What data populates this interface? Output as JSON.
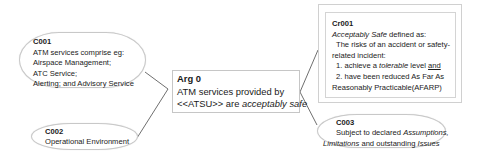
{
  "diagram": {
    "type": "GSN safety argument",
    "nodes": {
      "c001": {
        "id": "C001",
        "kind": "context",
        "lines": [
          "ATM services comprise eg:",
          "Airspace Management;",
          "ATC Service;",
          "Alerting; and Advisory Service"
        ]
      },
      "c002": {
        "id": "C002",
        "kind": "context",
        "lines": [
          "Operational Environment"
        ]
      },
      "arg0": {
        "id": "Arg 0",
        "kind": "goal",
        "line1": "ATM services provided by",
        "line2_prefix": "<<ATSU>> are ",
        "line2_italic": "acceptably safe"
      },
      "cr001": {
        "id": "Cr001",
        "kind": "criterion",
        "line1_italic": "Acceptably Safe",
        "line1_rest": " defined as:",
        "line2": "The risks of an accident or safety-",
        "line3": "related incident:",
        "line4_prefix": "1. achieve a ",
        "line4_italic": "tolerable",
        "line4_mid": " level ",
        "line4_underline": "and",
        "line5": "2. have been reduced As Far As",
        "line6": "Reasonably  Practicable(AFARP)"
      },
      "c003": {
        "id": "C003",
        "kind": "context",
        "line1_prefix": "Subject to declared ",
        "line1_italic": "Assumptions,",
        "line2_italic": "Limitations",
        "line2_mid": " and outstanding ",
        "line2_italic2": "Issues"
      }
    },
    "edges": [
      {
        "from": "Arg 0",
        "to": "C001"
      },
      {
        "from": "Arg 0",
        "to": "C002"
      },
      {
        "from": "Arg 0",
        "to": "Cr001"
      },
      {
        "from": "Arg 0",
        "to": "C003"
      }
    ],
    "colors": {
      "border": "#c8c8c8",
      "connector": "#4a4a4a",
      "text": "#1a1a1a",
      "background": "#ffffff"
    }
  }
}
